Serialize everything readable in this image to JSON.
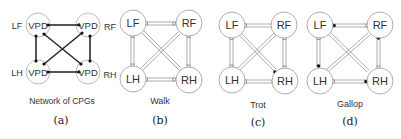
{
  "panels": [
    {
      "id": "a",
      "title": "Network of CPGs",
      "caption": "(a)",
      "node_text": "VPD",
      "outer_labels": {
        "LF": "LF",
        "RF": "RF",
        "LH": "LH",
        "RH": "RH"
      }
    },
    {
      "id": "b",
      "title": "Walk",
      "caption": "(b)",
      "nodes": {
        "LF": "LF",
        "RF": "RF",
        "LH": "LH",
        "RH": "RH"
      }
    },
    {
      "id": "c",
      "title": "Trot",
      "caption": "(c)",
      "nodes": {
        "LF": "LF",
        "RF": "RF",
        "LH": "LH",
        "RH": "RH"
      }
    },
    {
      "id": "d",
      "title": "Gallop",
      "caption": "(d)",
      "nodes": {
        "LF": "LF",
        "RF": "RF",
        "LH": "LH",
        "RH": "RH"
      }
    }
  ],
  "colors": {
    "stroke": "#2a2a2a",
    "node_stroke": "#9a9a9a",
    "text": "#333333"
  }
}
